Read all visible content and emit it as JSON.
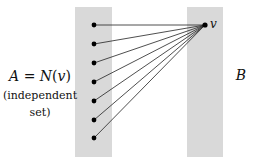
{
  "diagram": {
    "type": "bipartite-neighborhood",
    "colors": {
      "background": "#ffffff",
      "set_fill": "#d9d9d9",
      "edge": "#222222",
      "vertex": "#000000",
      "text": "#111111"
    },
    "left_set": {
      "label_line1": "A = N(v)",
      "label_line2": "(independent",
      "label_line3": "set)",
      "rect": {
        "x": 75,
        "y": 7,
        "width": 37,
        "height": 150
      },
      "vertices": [
        {
          "x": 94,
          "y": 25
        },
        {
          "x": 94,
          "y": 44
        },
        {
          "x": 94,
          "y": 63
        },
        {
          "x": 94,
          "y": 82
        },
        {
          "x": 94,
          "y": 101
        },
        {
          "x": 94,
          "y": 120
        },
        {
          "x": 94,
          "y": 138
        }
      ]
    },
    "right_set": {
      "label": "B",
      "rect": {
        "x": 187,
        "y": 7,
        "width": 36,
        "height": 150
      },
      "vertex": {
        "x": 205,
        "y": 25,
        "label": "v"
      }
    }
  }
}
